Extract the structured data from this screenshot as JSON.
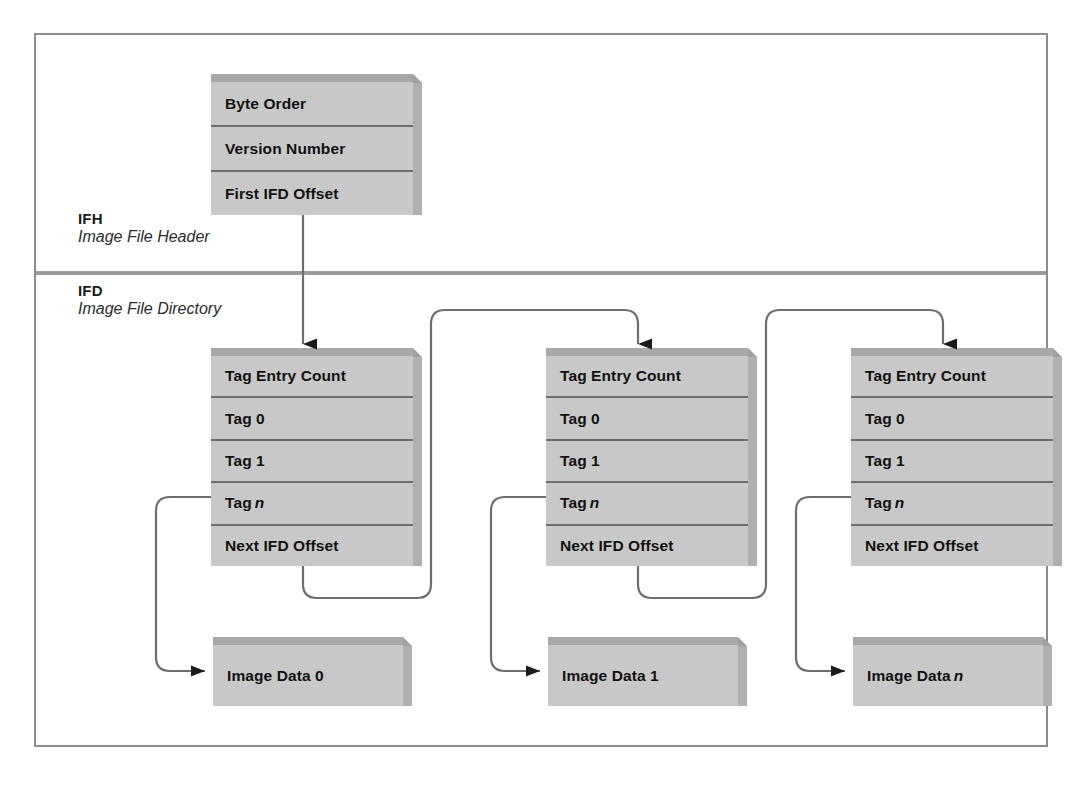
{
  "figure": {
    "background": "#ffffff",
    "frame_color": "#8c8c8c",
    "block_face_color": "#c8c8c8",
    "block_bevel_color": "#a8a8a8",
    "wire_color": "#666666"
  },
  "sections": [
    {
      "abbr": "IFH",
      "full": "Image File Header"
    },
    {
      "abbr": "IFD",
      "full": "Image File Directory"
    }
  ],
  "header_block": {
    "name": "image-file-header",
    "rows": [
      {
        "label": "Byte Order"
      },
      {
        "label": "Version Number"
      },
      {
        "label": "First IFD Offset"
      }
    ]
  },
  "ifd_blocks": [
    {
      "name": "ifd-0",
      "rows": [
        {
          "label": "Tag Entry Count",
          "italic": ""
        },
        {
          "label": "Tag 0",
          "italic": ""
        },
        {
          "label": "Tag 1",
          "italic": ""
        },
        {
          "label": "Tag",
          "italic": "n"
        },
        {
          "label": "Next IFD Offset",
          "italic": ""
        }
      ]
    },
    {
      "name": "ifd-1",
      "rows": [
        {
          "label": "Tag Entry Count",
          "italic": ""
        },
        {
          "label": "Tag 0",
          "italic": ""
        },
        {
          "label": "Tag 1",
          "italic": ""
        },
        {
          "label": "Tag",
          "italic": "n"
        },
        {
          "label": "Next IFD Offset",
          "italic": ""
        }
      ]
    },
    {
      "name": "ifd-n",
      "rows": [
        {
          "label": "Tag Entry Count",
          "italic": ""
        },
        {
          "label": "Tag 0",
          "italic": ""
        },
        {
          "label": "Tag 1",
          "italic": ""
        },
        {
          "label": "Tag",
          "italic": "n"
        },
        {
          "label": "Next IFD Offset",
          "italic": ""
        }
      ]
    }
  ],
  "image_data_blocks": [
    {
      "name": "image-data-0",
      "label": "Image Data 0",
      "italic": ""
    },
    {
      "name": "image-data-1",
      "label": "Image Data 1",
      "italic": ""
    },
    {
      "name": "image-data-n",
      "label": "Image Data",
      "italic": "n"
    }
  ]
}
